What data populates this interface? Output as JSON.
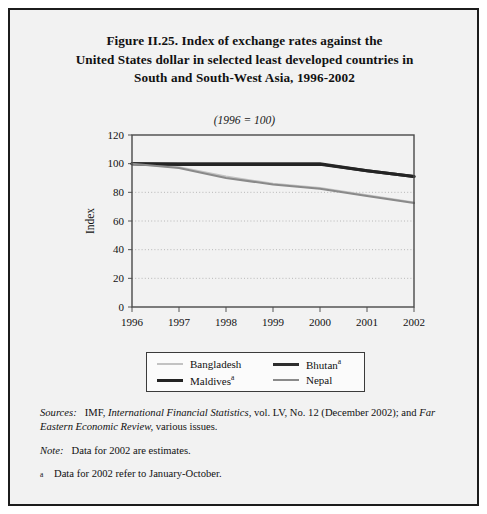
{
  "figure": {
    "title_lines": [
      "Figure II.25.  Index of exchange rates against the",
      "United States dollar in selected least developed countries in",
      "South and South-West Asia, 1996-2002"
    ],
    "subtitle": "(1996 = 100)"
  },
  "legend": {
    "items": [
      {
        "key": "bangladesh",
        "label": "Bangladesh",
        "marker": "",
        "color": "#c3c3c3",
        "width": 2
      },
      {
        "key": "bhutan",
        "label": "Bhutan",
        "marker": "a",
        "color": "#2e2e2e",
        "width": 3
      },
      {
        "key": "maldives",
        "label": "Maldives",
        "marker": "a",
        "color": "#242424",
        "width": 3
      },
      {
        "key": "nepal",
        "label": "Nepal",
        "marker": "",
        "color": "#8a8a8a",
        "width": 2
      }
    ]
  },
  "notes": {
    "sources_label": "Sources:",
    "sources_text_1": "IMF,",
    "sources_italic_1": "International Financial Statistics,",
    "sources_text_2": "vol. LV, No. 12 (December  2002); and",
    "sources_italic_2": "Far Eastern Economic Review,",
    "sources_text_3": "various issues.",
    "note_label": "Note:",
    "note_text": "Data for 2002 are estimates.",
    "footnote_mark": "a",
    "footnote_text": "Data for 2002 refer to January-October."
  },
  "chart_data": {
    "type": "line",
    "title": "Index of exchange rates against the United States dollar in selected least developed countries in South and South-West Asia, 1996-2002",
    "subtitle": "(1996 = 100)",
    "xlabel": "",
    "ylabel": "Index",
    "x": [
      1996,
      1997,
      1998,
      1999,
      2000,
      2001,
      2002
    ],
    "categories": [
      "1996",
      "1997",
      "1998",
      "1999",
      "2000",
      "2001",
      "2002"
    ],
    "xlim": [
      1996,
      2002
    ],
    "ylim": [
      0,
      120
    ],
    "yticks": [
      0,
      20,
      40,
      60,
      80,
      100,
      120
    ],
    "xticks": [
      "1996",
      "1997",
      "1998",
      "1999",
      "2000",
      "2001",
      "2002"
    ],
    "grid": "horizontal-dotted",
    "legend_position": "below-plot",
    "series": [
      {
        "name": "Bangladesh",
        "color": "#c3c3c3",
        "width": 2,
        "values": [
          100,
          97.5,
          91,
          86,
          83,
          78,
          73
        ]
      },
      {
        "name": "Bhutan",
        "color": "#2e2e2e",
        "width": 3,
        "values": [
          100,
          100,
          100,
          100,
          100,
          95,
          91
        ]
      },
      {
        "name": "Maldives",
        "color": "#242424",
        "width": 3,
        "values": [
          100,
          99.5,
          99.5,
          99.5,
          99.5,
          95,
          91
        ]
      },
      {
        "name": "Nepal",
        "color": "#8a8a8a",
        "width": 2,
        "values": [
          100,
          97,
          90,
          85.5,
          82.5,
          77.5,
          72.5
        ]
      }
    ]
  }
}
